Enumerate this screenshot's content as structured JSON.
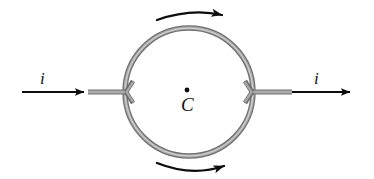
{
  "figure": {
    "background_color": "#ffffff",
    "width": 374,
    "height": 179
  },
  "labels": {
    "current_left": "i",
    "current_right": "i",
    "center_point": "C"
  },
  "colors": {
    "wire_gray": "#8a8a8a",
    "wire_gray_edge": "#6e6e6e",
    "wire_gray_light": "#b4b4b4",
    "arrow_black": "#0d0d0d",
    "text_black": "#141414"
  },
  "geometry": {
    "ring_center_x": 189,
    "ring_center_y": 92,
    "ring_radius": 64,
    "ring_stroke_width": 5,
    "lead_y": 92,
    "left_lead_x_start": 88,
    "left_lead_x_end": 125,
    "right_lead_x_start": 253,
    "right_lead_x_end": 292,
    "left_arrow_x_start": 22,
    "left_arrow_x_end": 86,
    "right_arrow_x_start": 292,
    "right_arrow_x_end": 352,
    "center_dot_x": 187,
    "center_dot_y": 90,
    "center_dot_radius": 2.4
  },
  "annotations": {
    "top_arc_arrow": {
      "name": "clockwise-direction-arrow-top",
      "from_x": 157,
      "to_x": 224,
      "y": 16,
      "curve": "concave-down",
      "points": "right"
    },
    "bottom_arc_arrow": {
      "name": "clockwise-direction-arrow-bottom",
      "from_x": 157,
      "to_x": 226,
      "y": 166,
      "curve": "concave-up",
      "points": "right"
    }
  },
  "icons": {
    "arrowhead": "solid-triangle-arrowhead",
    "center_dot": "filled-dot-icon",
    "ring": "circular-loop-icon"
  }
}
